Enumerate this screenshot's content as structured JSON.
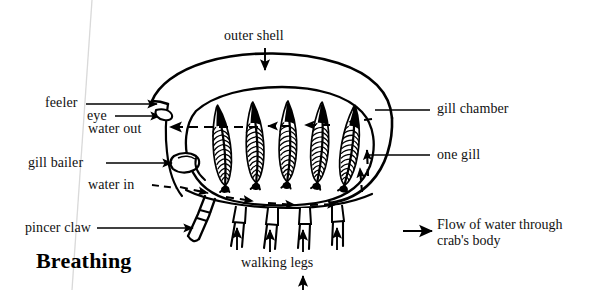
{
  "figure": {
    "title": "Breathing"
  },
  "labels": {
    "outer_shell": "outer shell",
    "feeler": "feeler",
    "eye": "eye",
    "water_out": "water out",
    "gill_bailer": "gill bailer",
    "water_in": "water in",
    "pincer_claw": "pincer claw",
    "gill_chamber": "gill chamber",
    "one_gill": "one gill",
    "walking_legs": "walking legs"
  },
  "legend": {
    "line1": "Flow of water through",
    "line2": "crab's body"
  },
  "colors": {
    "ink": "#000000",
    "text": "#111111",
    "paper": "#ffffff",
    "scan_artifact": "#d9d9d9"
  },
  "diagram_parts": {
    "gill_count": 5,
    "walking_leg_count": 4,
    "pincer_claw_count": 1,
    "flow_in_arrows": 4,
    "flow_out_arrows": 1,
    "upward_flow_arrows": 5
  }
}
